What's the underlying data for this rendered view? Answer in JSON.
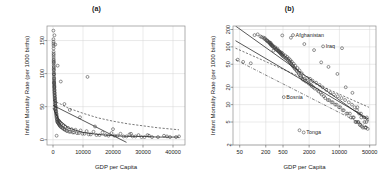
{
  "figure": {
    "width": 386,
    "height": 188,
    "background": "#ffffff"
  },
  "panels": [
    {
      "id": "a",
      "title": "(a)",
      "xlabel": "GDP per Capita",
      "ylabel": "Infant Mortality Rate (per 1000 births)"
    },
    {
      "id": "b",
      "title": "(b)",
      "xlabel": "GDP per Capita",
      "ylabel": "Infant Mortality Rate (per 1000 births)"
    }
  ],
  "chart_data": [
    {
      "type": "scatter",
      "panel": "a",
      "title": "(a)",
      "xlabel": "GDP per Capita",
      "ylabel": "Infant Mortality Rate (per 1000 births)",
      "xscale": "linear",
      "yscale": "linear",
      "xlim": [
        -2000,
        44000
      ],
      "ylim": [
        -8,
        172
      ],
      "xticks": [
        0,
        10000,
        20000,
        30000,
        40000
      ],
      "xticklabels": [
        "0",
        "10000",
        "20000",
        "30000",
        "40000"
      ],
      "yticks": [
        0,
        50,
        100,
        150
      ],
      "yticklabels": [
        "0",
        "50",
        "100",
        "150"
      ],
      "grid": true,
      "legend": "none",
      "marker": "open-circle",
      "x": [
        130,
        150,
        160,
        175,
        185,
        190,
        200,
        210,
        215,
        220,
        230,
        240,
        245,
        250,
        255,
        260,
        265,
        270,
        280,
        285,
        290,
        300,
        310,
        320,
        330,
        340,
        350,
        360,
        370,
        380,
        390,
        400,
        410,
        420,
        430,
        440,
        450,
        460,
        470,
        480,
        490,
        500,
        520,
        540,
        560,
        580,
        600,
        620,
        640,
        660,
        680,
        700,
        720,
        740,
        760,
        780,
        800,
        820,
        850,
        880,
        900,
        930,
        960,
        1000,
        1040,
        1080,
        1120,
        1160,
        1200,
        1250,
        1300,
        1350,
        1400,
        1450,
        1500,
        1600,
        1700,
        1800,
        1900,
        2000,
        2100,
        2200,
        2300,
        2400,
        2500,
        2700,
        2900,
        3100,
        3300,
        3500,
        3700,
        3900,
        4100,
        4400,
        4700,
        5000,
        5400,
        5800,
        6200,
        6600,
        7000,
        7500,
        8000,
        8600,
        9200,
        9800,
        10500,
        11200,
        11900,
        12600,
        13500,
        14500,
        15500,
        16500,
        17500,
        18500,
        19500,
        20500,
        21500,
        22500,
        23500,
        24500,
        25500,
        26500,
        27500,
        28500,
        29500,
        30500,
        31500,
        33000,
        35000,
        37000,
        39000,
        41000,
        1200,
        11500,
        2600,
        300,
        480,
        760,
        1550,
        3800,
        5600,
        9000,
        14000,
        20000,
        26000,
        32000,
        38000,
        42000
      ],
      "y": [
        165,
        152,
        148,
        145,
        138,
        142,
        133,
        128,
        130,
        125,
        122,
        118,
        120,
        115,
        112,
        117,
        108,
        110,
        105,
        102,
        106,
        100,
        98,
        95,
        99,
        92,
        90,
        88,
        93,
        85,
        87,
        82,
        84,
        80,
        78,
        81,
        76,
        74,
        79,
        72,
        70,
        75,
        68,
        66,
        71,
        64,
        62,
        67,
        60,
        58,
        63,
        56,
        54,
        59,
        52,
        50,
        55,
        48,
        46,
        51,
        44,
        42,
        47,
        40,
        38,
        43,
        36,
        34,
        39,
        32,
        30,
        35,
        28,
        27,
        31,
        26,
        25,
        29,
        24,
        23,
        28,
        22,
        21,
        26,
        20,
        19,
        24,
        18,
        17,
        22,
        16,
        15,
        20,
        14,
        13,
        18,
        12,
        12,
        16,
        11,
        11,
        15,
        10,
        10,
        14,
        9,
        9,
        13,
        8,
        8,
        12,
        7,
        7,
        11,
        7,
        6,
        10,
        6,
        6,
        9,
        5,
        5,
        8,
        5,
        5,
        7,
        4,
        4,
        7,
        4,
        4,
        6,
        4,
        4,
        6,
        95,
        88,
        86,
        158,
        144,
        112,
        54,
        45,
        34,
        20,
        16,
        9,
        6,
        5,
        5,
        4
      ],
      "fits": [
        {
          "name": "ols-linear",
          "style": "solid",
          "points": [
            [
              0,
              52
            ],
            [
              24500,
              -4
            ]
          ]
        },
        {
          "name": "robust-curve",
          "style": "dashed",
          "points": [
            [
              0,
              60
            ],
            [
              5000,
              48
            ],
            [
              10000,
              40
            ],
            [
              15000,
              33
            ],
            [
              20000,
              28
            ],
            [
              25000,
              24
            ],
            [
              30000,
              21
            ],
            [
              35000,
              18
            ],
            [
              42000,
              15
            ]
          ]
        },
        {
          "name": "lowess",
          "style": "solid-flat",
          "points": [
            [
              0,
              48
            ],
            [
              2000,
              30
            ],
            [
              5000,
              18
            ],
            [
              10000,
              11
            ],
            [
              15000,
              8
            ],
            [
              20000,
              6
            ],
            [
              25000,
              5
            ],
            [
              30000,
              5
            ],
            [
              35000,
              4
            ],
            [
              42000,
              4
            ]
          ]
        }
      ],
      "annotations": []
    },
    {
      "type": "scatter",
      "panel": "b",
      "title": "(b)",
      "xlabel": "GDP per Capita",
      "ylabel": "Infant Mortality Rate (per 1000 births)",
      "xscale": "log",
      "yscale": "log",
      "xlim": [
        35,
        70000
      ],
      "ylim": [
        2,
        230
      ],
      "xticks": [
        50,
        200,
        500,
        2000,
        10000,
        50000
      ],
      "xticklabels": [
        "50",
        "200",
        "500",
        "2000",
        "10000",
        "50000"
      ],
      "yticks": [
        2,
        5,
        10,
        20,
        50,
        100,
        200
      ],
      "yticklabels": [
        "2",
        "5",
        "10",
        "20",
        "50",
        "100",
        "200"
      ],
      "grid": true,
      "legend": "none",
      "marker": "open-circle",
      "x": [
        45,
        60,
        90,
        110,
        130,
        150,
        160,
        175,
        185,
        190,
        200,
        210,
        215,
        220,
        230,
        240,
        245,
        250,
        255,
        260,
        265,
        270,
        280,
        285,
        290,
        300,
        310,
        320,
        330,
        340,
        350,
        360,
        370,
        380,
        390,
        400,
        410,
        420,
        430,
        440,
        450,
        460,
        470,
        480,
        490,
        500,
        520,
        540,
        560,
        580,
        600,
        620,
        640,
        660,
        680,
        700,
        720,
        740,
        760,
        780,
        800,
        820,
        850,
        880,
        900,
        930,
        960,
        1000,
        1040,
        1080,
        1120,
        1160,
        1200,
        1250,
        1300,
        1350,
        1400,
        1450,
        1500,
        1600,
        1700,
        1800,
        1900,
        2000,
        2100,
        2200,
        2300,
        2400,
        2500,
        2700,
        2900,
        3100,
        3300,
        3500,
        3700,
        3900,
        4100,
        4400,
        4700,
        5000,
        5400,
        5800,
        6200,
        6600,
        7000,
        7500,
        8000,
        8600,
        9200,
        9800,
        10500,
        11200,
        11900,
        12600,
        13500,
        14500,
        15500,
        16500,
        17500,
        18500,
        19500,
        20500,
        21500,
        22500,
        23500,
        24500,
        25500,
        26500,
        27500,
        28500,
        29500,
        30500,
        31500,
        33000,
        35000,
        37000,
        39000,
        41000,
        43000,
        45000,
        1200,
        11500,
        2600,
        300,
        480,
        760,
        1550,
        3800,
        5600,
        9000,
        14000,
        20000,
        26000,
        32000,
        38000,
        42000
      ],
      "y": [
        60,
        55,
        52,
        160,
        165,
        152,
        148,
        145,
        138,
        142,
        133,
        128,
        130,
        125,
        122,
        118,
        120,
        115,
        112,
        117,
        108,
        110,
        105,
        102,
        106,
        100,
        98,
        95,
        99,
        92,
        90,
        88,
        93,
        85,
        87,
        82,
        84,
        80,
        78,
        81,
        76,
        74,
        79,
        72,
        70,
        75,
        68,
        66,
        71,
        64,
        62,
        67,
        60,
        58,
        63,
        56,
        54,
        59,
        52,
        50,
        55,
        48,
        46,
        51,
        44,
        42,
        47,
        40,
        38,
        43,
        36,
        34,
        39,
        32,
        30,
        35,
        28,
        27,
        31,
        26,
        25,
        29,
        24,
        23,
        28,
        22,
        21,
        26,
        20,
        19,
        24,
        18,
        17,
        22,
        16,
        15,
        20,
        14,
        13,
        18,
        12,
        12,
        16,
        11,
        11,
        15,
        10,
        10,
        14,
        9,
        9,
        13,
        8,
        8,
        12,
        7,
        7,
        11,
        7,
        6,
        10,
        6,
        6,
        9,
        5,
        5,
        8,
        5,
        5,
        7,
        4.5,
        4.4,
        7,
        4.2,
        4,
        6,
        4,
        4,
        6,
        3.8,
        3.6,
        95,
        88,
        86,
        158,
        144,
        112,
        54,
        45,
        34,
        20,
        16,
        9,
        6,
        5,
        5,
        4
      ],
      "fits": [
        {
          "name": "ols-log-log",
          "style": "solid",
          "points": [
            [
              40,
              230
            ],
            [
              48000,
              5.2
            ]
          ]
        },
        {
          "name": "robust-fit",
          "style": "solid",
          "points": [
            [
              40,
              128
            ],
            [
              48000,
              5.6
            ]
          ]
        },
        {
          "name": "quantile-upper",
          "style": "dashed",
          "points": [
            [
              40,
              95
            ],
            [
              48000,
              9
            ]
          ]
        },
        {
          "name": "quantile-lower",
          "style": "dotdash",
          "points": [
            [
              40,
              60
            ],
            [
              48000,
              4
            ]
          ]
        }
      ],
      "annotations": [
        {
          "label": "Afghanistan",
          "x": 850,
          "y": 160
        },
        {
          "label": "Iraq",
          "x": 4200,
          "y": 102
        },
        {
          "label": "Bosnia",
          "x": 520,
          "y": 13.5
        },
        {
          "label": "Tonga",
          "x": 1500,
          "y": 3.3
        }
      ]
    }
  ]
}
